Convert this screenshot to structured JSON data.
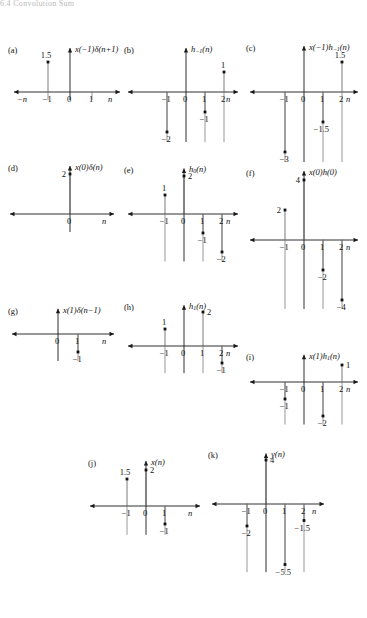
{
  "page": {
    "header_text": "6.4  Convolution Sum",
    "axis_arrow_color": "#1a1a1a",
    "stem_color": "#6b6b6b",
    "marker_color": "#111111",
    "text_color": "#111111"
  },
  "panels": [
    {
      "tag": "(a)",
      "title_html": "<i>x</i>(&#8722;1)&#948;(<i>n</i>+1)",
      "xaxis_label": "n",
      "xaxis_left_label": "−n",
      "ticks": [
        {
          "x": -1,
          "label": "−1"
        },
        {
          "x": 0,
          "label": "0"
        },
        {
          "x": 1,
          "label": "1"
        }
      ],
      "stems": [
        {
          "x": -1,
          "y": 1.5,
          "value_label": "1.5",
          "label_pos": "above"
        }
      ],
      "ymax": 2.2,
      "ymin": -0.4
    },
    {
      "tag": "(b)",
      "title_html": "<i>h</i><span class=\"sub\">−1</span>(<i>n</i>)",
      "xaxis_label": "n",
      "xaxis_left_label": "",
      "ticks": [
        {
          "x": -1,
          "label": "−1"
        },
        {
          "x": 0,
          "label": "0"
        },
        {
          "x": 1,
          "label": "1"
        },
        {
          "x": 2,
          "label": "2"
        }
      ],
      "stems": [
        {
          "x": -1,
          "y": -2,
          "value_label": "−2",
          "label_pos": "below"
        },
        {
          "x": 1,
          "y": -1,
          "value_label": "−1",
          "label_pos": "below"
        },
        {
          "x": 2,
          "y": 1,
          "value_label": "1",
          "label_pos": "above"
        }
      ],
      "ymax": 2.2,
      "ymin": -2.5
    },
    {
      "tag": "(c)",
      "title_html": "<i>x</i>(&#8722;1)<i>h</i><span class=\"sub\">−1</span>(<i>n</i>)",
      "xaxis_label": "n",
      "xaxis_left_label": "",
      "ticks": [
        {
          "x": -1,
          "label": "−1"
        },
        {
          "x": 0,
          "label": "0"
        },
        {
          "x": 1,
          "label": "1"
        },
        {
          "x": 2,
          "label": "2"
        }
      ],
      "stems": [
        {
          "x": -1,
          "y": -3,
          "value_label": "−3",
          "label_pos": "below"
        },
        {
          "x": 1,
          "y": -1.5,
          "value_label": "−1.5",
          "label_pos": "below"
        },
        {
          "x": 2,
          "y": 1.5,
          "value_label": "1.5",
          "label_pos": "above"
        }
      ],
      "ymax": 2.3,
      "ymin": -3.5
    },
    {
      "tag": "(d)",
      "title_html": "<i>x</i>(0)&#948;(<i>n</i>)",
      "xaxis_label": "n",
      "xaxis_left_label": "",
      "ticks": [
        {
          "x": 0,
          "label": "0"
        }
      ],
      "stems": [
        {
          "x": 0,
          "y": 2,
          "value_label": "2",
          "label_pos": "left"
        }
      ],
      "ymax": 2.4,
      "ymin": -0.9
    },
    {
      "tag": "(e)",
      "title_html": "<i>h</i><span class=\"sub\">0</span>(<i>n</i>)",
      "xaxis_label": "n",
      "xaxis_left_label": "",
      "ticks": [
        {
          "x": -1,
          "label": "−1"
        },
        {
          "x": 0,
          "label": "0"
        },
        {
          "x": 1,
          "label": "1"
        },
        {
          "x": 2,
          "label": "2"
        }
      ],
      "stems": [
        {
          "x": -1,
          "y": 1,
          "value_label": "1",
          "label_pos": "above"
        },
        {
          "x": 0,
          "y": 2,
          "value_label": "2",
          "label_pos": "right"
        },
        {
          "x": 1,
          "y": -1,
          "value_label": "−1",
          "label_pos": "below"
        },
        {
          "x": 2,
          "y": -2,
          "value_label": "−2",
          "label_pos": "below"
        }
      ],
      "ymax": 2.4,
      "ymin": -2.5
    },
    {
      "tag": "(f)",
      "title_html": "<i>x</i>(0)<i>h</i>(0)",
      "xaxis_label": "n",
      "xaxis_left_label": "",
      "ticks": [
        {
          "x": -1,
          "label": "−1"
        },
        {
          "x": 0,
          "label": "0"
        },
        {
          "x": 1,
          "label": "1"
        },
        {
          "x": 2,
          "label": "2"
        }
      ],
      "stems": [
        {
          "x": -1,
          "y": 2,
          "value_label": "2",
          "label_pos": "left"
        },
        {
          "x": 0,
          "y": 4,
          "value_label": "4",
          "label_pos": "left"
        },
        {
          "x": 1,
          "y": -2,
          "value_label": "−2",
          "label_pos": "below"
        },
        {
          "x": 2,
          "y": -4,
          "value_label": "−4",
          "label_pos": "below"
        }
      ],
      "ymax": 4.6,
      "ymin": -4.6
    },
    {
      "tag": "(g)",
      "title_html": "<i>x</i>(1)&#948;(<i>n</i>−1)",
      "xaxis_label": "n",
      "xaxis_left_label": "",
      "ticks": [
        {
          "x": 0,
          "label": "0"
        },
        {
          "x": 1,
          "label": "1"
        }
      ],
      "stems": [
        {
          "x": 1,
          "y": -1,
          "value_label": "−1",
          "label_pos": "below"
        }
      ],
      "ymax": 1.4,
      "ymin": -1.5
    },
    {
      "tag": "(h)",
      "title_html": "<i>h</i><span class=\"sub\">1</span>(<i>n</i>)",
      "xaxis_label": "n",
      "xaxis_left_label": "",
      "ticks": [
        {
          "x": -1,
          "label": "−1"
        },
        {
          "x": 0,
          "label": "0"
        },
        {
          "x": 1,
          "label": "1"
        },
        {
          "x": 2,
          "label": "2"
        }
      ],
      "stems": [
        {
          "x": -1,
          "y": 1,
          "value_label": "1",
          "label_pos": "above"
        },
        {
          "x": 1,
          "y": 2,
          "value_label": "2",
          "label_pos": "right"
        },
        {
          "x": 2,
          "y": -1,
          "value_label": "−1",
          "label_pos": "below"
        }
      ],
      "ymax": 2.4,
      "ymin": -1.6
    },
    {
      "tag": "(i)",
      "title_html": "<i>x</i>(1)<i>h</i><span class=\"sub\">1</span>(<i>n</i>)",
      "xaxis_label": "n",
      "xaxis_left_label": "",
      "ticks": [
        {
          "x": -1,
          "label": "−1"
        },
        {
          "x": 0,
          "label": "0"
        },
        {
          "x": 1,
          "label": "1"
        },
        {
          "x": 2,
          "label": "2"
        }
      ],
      "stems": [
        {
          "x": -1,
          "y": -1,
          "value_label": "−1",
          "label_pos": "below"
        },
        {
          "x": 1,
          "y": -2,
          "value_label": "−2",
          "label_pos": "below"
        },
        {
          "x": 2,
          "y": 1,
          "value_label": "1",
          "label_pos": "right"
        }
      ],
      "ymax": 1.6,
      "ymin": -2.5
    },
    {
      "tag": "(j)",
      "title_html": "<i>x</i>(<i>n</i>)",
      "xaxis_label": "n",
      "xaxis_left_label": "",
      "ticks": [
        {
          "x": -1,
          "label": "−1"
        },
        {
          "x": 0,
          "label": "0"
        },
        {
          "x": 1,
          "label": "1"
        }
      ],
      "stems": [
        {
          "x": -1,
          "y": 1.5,
          "value_label": "1.5",
          "label_pos": "above"
        },
        {
          "x": 0,
          "y": 2,
          "value_label": "2",
          "label_pos": "right"
        },
        {
          "x": 1,
          "y": -1,
          "value_label": "−1",
          "label_pos": "below"
        }
      ],
      "ymax": 2.5,
      "ymin": -1.6
    },
    {
      "tag": "(k)",
      "title_html": "<i>y</i>(<i>n</i>)",
      "xaxis_label": "n",
      "xaxis_left_label": "",
      "ticks": [
        {
          "x": -1,
          "label": "−1"
        },
        {
          "x": 0,
          "label": "0"
        },
        {
          "x": 1,
          "label": "1"
        },
        {
          "x": 2,
          "label": "2"
        }
      ],
      "stems": [
        {
          "x": -1,
          "y": -2,
          "value_label": "−2",
          "label_pos": "below"
        },
        {
          "x": 0,
          "y": 4,
          "value_label": "4",
          "label_pos": "right"
        },
        {
          "x": 2,
          "y": -1.5,
          "value_label": "−1.5",
          "label_pos": "below"
        },
        {
          "x": 1,
          "y": -5.5,
          "value_label": "−5.5",
          "label_pos": "below"
        }
      ],
      "ymax": 4.6,
      "ymin": -6.2
    }
  ],
  "layout": [
    {
      "left": 8,
      "top": 14,
      "w": 112,
      "h": 110,
      "ox": 62,
      "oy": 78,
      "step": 22,
      "xneg": 56,
      "xpos": 50,
      "yscale": 20
    },
    {
      "left": 124,
      "top": 14,
      "w": 118,
      "h": 124,
      "ox": 62,
      "oy": 78,
      "step": 19,
      "xneg": 58,
      "xpos": 52,
      "yscale": 20
    },
    {
      "left": 246,
      "top": 14,
      "w": 118,
      "h": 130,
      "ox": 58,
      "oy": 78,
      "step": 19,
      "xneg": 54,
      "xpos": 54,
      "yscale": 20
    },
    {
      "left": 8,
      "top": 160,
      "w": 112,
      "h": 80,
      "ox": 62,
      "oy": 54,
      "step": 20,
      "xneg": 60,
      "xpos": 44,
      "yscale": 20
    },
    {
      "left": 124,
      "top": 160,
      "w": 118,
      "h": 100,
      "ox": 60,
      "oy": 54,
      "step": 19,
      "xneg": 56,
      "xpos": 54,
      "yscale": 19
    },
    {
      "left": 246,
      "top": 160,
      "w": 118,
      "h": 125,
      "ox": 58,
      "oy": 80,
      "step": 19,
      "xneg": 54,
      "xpos": 54,
      "yscale": 15
    },
    {
      "left": 8,
      "top": 296,
      "w": 112,
      "h": 70,
      "ox": 50,
      "oy": 38,
      "step": 20,
      "xneg": 46,
      "xpos": 56,
      "yscale": 18
    },
    {
      "left": 124,
      "top": 296,
      "w": 118,
      "h": 90,
      "ox": 60,
      "oy": 50,
      "step": 19,
      "xneg": 56,
      "xpos": 54,
      "yscale": 17
    },
    {
      "left": 246,
      "top": 330,
      "w": 118,
      "h": 95,
      "ox": 58,
      "oy": 52,
      "step": 19,
      "xneg": 54,
      "xpos": 54,
      "yscale": 17
    },
    {
      "left": 88,
      "top": 436,
      "w": 118,
      "h": 110,
      "ox": 58,
      "oy": 70,
      "step": 19,
      "xneg": 56,
      "xpos": 54,
      "yscale": 18
    },
    {
      "left": 208,
      "top": 436,
      "w": 125,
      "h": 140,
      "ox": 58,
      "oy": 68,
      "step": 19,
      "xneg": 54,
      "xpos": 58,
      "yscale": 11
    }
  ]
}
